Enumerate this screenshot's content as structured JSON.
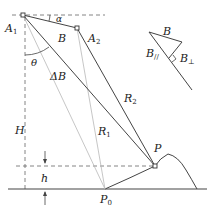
{
  "labels": {
    "A1": {
      "main": "A",
      "sub": "1"
    },
    "A2": {
      "main": "A",
      "sub": "2"
    },
    "alpha": "α",
    "theta": "θ",
    "B": "B",
    "deltaB": "ΔB",
    "R1": {
      "main": "R",
      "sub": "1"
    },
    "R2": {
      "main": "R",
      "sub": "2"
    },
    "H": "H",
    "h": "h",
    "P": "P",
    "P0": {
      "main": "P",
      "sub": "0"
    },
    "inset": {
      "B": "B",
      "B_par": {
        "main": "B",
        "sub": "//"
      },
      "B_perp": {
        "main": "B",
        "sub": "⊥"
      }
    }
  },
  "colors": {
    "line": "#444444",
    "light_line": "#b8b8b8",
    "dash": "#666666",
    "text": "#222222"
  }
}
